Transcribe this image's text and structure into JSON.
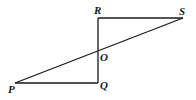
{
  "diagram": {
    "type": "geometry",
    "points": {
      "P": {
        "label": "P",
        "x": 15,
        "y": 83
      },
      "Q": {
        "label": "Q",
        "x": 98,
        "y": 83
      },
      "O": {
        "label": "O",
        "x": 98,
        "y": 51
      },
      "R": {
        "label": "R",
        "x": 98,
        "y": 18
      },
      "S": {
        "label": "S",
        "x": 183,
        "y": 18
      }
    },
    "segments": [
      "RS",
      "RQ",
      "PQ",
      "PS"
    ],
    "labels": {
      "P": "P",
      "Q": "Q",
      "O": "O",
      "R": "R",
      "S": "S"
    },
    "stroke_color": "#1a1a1a"
  }
}
